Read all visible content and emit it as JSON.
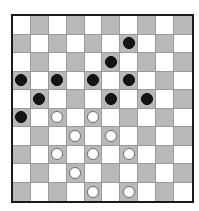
{
  "board": {
    "size": 10,
    "colors": {
      "light": "#ffffff",
      "dark": "#b9b9b9",
      "border": "#1a1a1a",
      "black_piece": "#141414",
      "white_piece": "#ffffff"
    },
    "dark_square_rule": "(row+col) odd",
    "pieces": {
      "black": [
        {
          "row": 1,
          "col": 6
        },
        {
          "row": 2,
          "col": 5
        },
        {
          "row": 3,
          "col": 0
        },
        {
          "row": 3,
          "col": 2
        },
        {
          "row": 3,
          "col": 4
        },
        {
          "row": 3,
          "col": 6
        },
        {
          "row": 4,
          "col": 1
        },
        {
          "row": 4,
          "col": 5
        },
        {
          "row": 4,
          "col": 7
        },
        {
          "row": 5,
          "col": 0
        }
      ],
      "white": [
        {
          "row": 5,
          "col": 2
        },
        {
          "row": 5,
          "col": 4
        },
        {
          "row": 6,
          "col": 3
        },
        {
          "row": 6,
          "col": 5
        },
        {
          "row": 7,
          "col": 2
        },
        {
          "row": 7,
          "col": 4
        },
        {
          "row": 7,
          "col": 6
        },
        {
          "row": 8,
          "col": 3
        },
        {
          "row": 9,
          "col": 4
        },
        {
          "row": 9,
          "col": 6
        }
      ]
    }
  }
}
